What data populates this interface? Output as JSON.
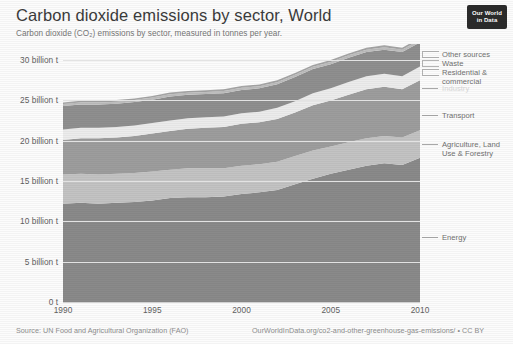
{
  "header": {
    "title": "Carbon dioxide emissions by sector, World",
    "subtitle": "Carbon dioxide (CO₂) emissions by sector, measured in tonnes per year."
  },
  "logo": {
    "line1": "Our World",
    "line2": "in Data"
  },
  "footer": {
    "source": "Source: UN Food and Agricultural Organization (FAO)",
    "credit": "OurWorldInData.org/co2-and-other-greenhouse-gas-emissions/ • CC BY"
  },
  "chart_data": {
    "type": "area",
    "title": "Carbon dioxide emissions by sector, World",
    "subtitle": "Carbon dioxide (CO₂) emissions by sector, measured in tonnes per year.",
    "xlabel": "",
    "ylabel": "",
    "xlim": [
      1990,
      2010
    ],
    "ylim": [
      0,
      32000000000
    ],
    "grid": true,
    "stacked": true,
    "legend_position": "right",
    "x": [
      1990,
      1991,
      1992,
      1993,
      1994,
      1995,
      1996,
      1997,
      1998,
      1999,
      2000,
      2001,
      2002,
      2003,
      2004,
      2005,
      2006,
      2007,
      2008,
      2009,
      2010
    ],
    "xticks": [
      "1990",
      "1995",
      "2000",
      "2005",
      "2010"
    ],
    "xtick_values": [
      1990,
      1995,
      2000,
      2005,
      2010
    ],
    "yticks": [
      "0 t",
      "5 billion t",
      "10 billion t",
      "15 billion t",
      "20 billion t",
      "25 billion t",
      "30 billion t"
    ],
    "ytick_values": [
      0,
      5000000000,
      10000000000,
      15000000000,
      20000000000,
      25000000000,
      30000000000
    ],
    "ytick_unit": "billion t",
    "series": [
      {
        "name": "Energy",
        "color": "#8a8a8a",
        "order": 1,
        "values_billion_t": [
          12.2,
          12.3,
          12.2,
          12.3,
          12.4,
          12.6,
          12.9,
          13.0,
          13.0,
          13.1,
          13.4,
          13.6,
          13.9,
          14.6,
          15.3,
          15.9,
          16.4,
          16.9,
          17.2,
          17.0,
          17.9
        ]
      },
      {
        "name": "Agriculture, Land Use & Forestry",
        "color": "#c3c3c3",
        "order": 2,
        "values_billion_t": [
          3.6,
          3.6,
          3.6,
          3.6,
          3.6,
          3.6,
          3.5,
          3.6,
          3.6,
          3.5,
          3.5,
          3.5,
          3.5,
          3.5,
          3.5,
          3.4,
          3.4,
          3.4,
          3.4,
          3.4,
          3.4
        ]
      },
      {
        "name": "Transport",
        "color": "#9d9d9d",
        "order": 3,
        "values_billion_t": [
          4.3,
          4.4,
          4.5,
          4.5,
          4.6,
          4.7,
          4.8,
          4.9,
          5.0,
          5.1,
          5.2,
          5.2,
          5.3,
          5.4,
          5.6,
          5.7,
          5.9,
          6.1,
          6.1,
          6.0,
          6.2
        ]
      },
      {
        "name": "Industry",
        "color": "#ececec",
        "order": 4,
        "values_billion_t": [
          1.3,
          1.3,
          1.3,
          1.3,
          1.3,
          1.3,
          1.3,
          1.3,
          1.3,
          1.3,
          1.3,
          1.3,
          1.4,
          1.4,
          1.5,
          1.5,
          1.6,
          1.6,
          1.6,
          1.6,
          1.7
        ]
      },
      {
        "name": "Residential & commercial",
        "color": "#8f8f8f",
        "order": 5,
        "values_billion_t": [
          2.9,
          2.9,
          2.9,
          2.9,
          2.9,
          2.9,
          3.0,
          2.9,
          2.9,
          2.9,
          2.9,
          2.9,
          2.9,
          3.0,
          3.0,
          3.0,
          3.0,
          3.0,
          3.0,
          3.0,
          3.0
        ]
      },
      {
        "name": "Waste",
        "color": "#bdbdbd",
        "order": 6,
        "values_billion_t": [
          0.25,
          0.25,
          0.25,
          0.25,
          0.25,
          0.26,
          0.26,
          0.26,
          0.26,
          0.27,
          0.27,
          0.27,
          0.27,
          0.28,
          0.28,
          0.28,
          0.29,
          0.29,
          0.29,
          0.3,
          0.3
        ]
      },
      {
        "name": "Other sources",
        "color": "#a5a5a5",
        "order": 7,
        "values_billion_t": [
          0.2,
          0.2,
          0.2,
          0.2,
          0.2,
          0.2,
          0.21,
          0.21,
          0.21,
          0.21,
          0.22,
          0.22,
          0.22,
          0.22,
          0.23,
          0.23,
          0.23,
          0.24,
          0.24,
          0.24,
          0.25
        ]
      }
    ],
    "totals_billion_t": [
      24.75,
      24.95,
      24.95,
      25.05,
      25.25,
      25.56,
      25.97,
      26.17,
      26.27,
      26.38,
      26.79,
      26.99,
      27.49,
      28.38,
      29.41,
      30.01,
      30.82,
      31.53,
      31.83,
      31.54,
      32.75
    ],
    "annotations": []
  },
  "legend": {
    "items": [
      {
        "label": "Other sources",
        "marker": "bracket"
      },
      {
        "label": "Waste",
        "marker": "bracket"
      },
      {
        "label": "Residential &\ncommercial",
        "marker": "bracket"
      },
      {
        "label": "Industry",
        "marker": "line"
      },
      {
        "label": "Transport",
        "marker": "line"
      },
      {
        "label": "Agriculture, Land\nUse & Forestry",
        "marker": "line"
      },
      {
        "label": "Energy",
        "marker": "line"
      }
    ]
  }
}
